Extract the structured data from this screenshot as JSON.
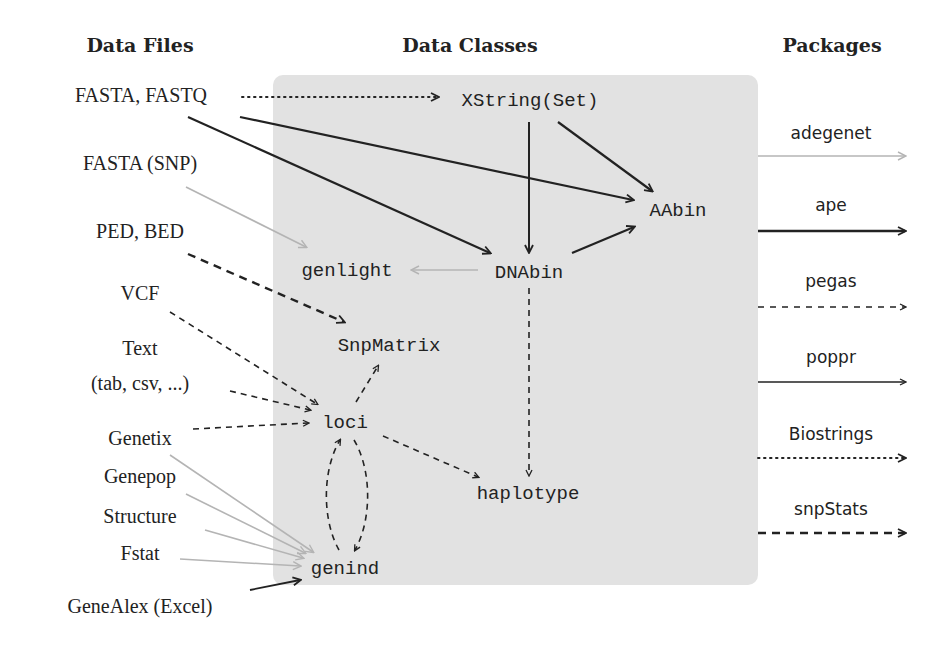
{
  "headers": {
    "files": "Data Files",
    "classes": "Data Classes",
    "packages": "Packages"
  },
  "files": [
    {
      "id": "fasta",
      "label": "FASTA, FASTQ"
    },
    {
      "id": "fasta_snp",
      "label": "FASTA (SNP)"
    },
    {
      "id": "ped",
      "label": "PED, BED"
    },
    {
      "id": "vcf",
      "label": "VCF"
    },
    {
      "id": "text1",
      "label": "Text"
    },
    {
      "id": "text2",
      "label": "(tab, csv, ...)"
    },
    {
      "id": "genetix",
      "label": "Genetix"
    },
    {
      "id": "genepop",
      "label": "Genepop"
    },
    {
      "id": "structure",
      "label": "Structure"
    },
    {
      "id": "fstat",
      "label": "Fstat"
    },
    {
      "id": "genealex",
      "label": "GeneAlex (Excel)"
    }
  ],
  "classes": [
    {
      "id": "xstring",
      "label": "XString(Set)"
    },
    {
      "id": "aabin",
      "label": "AAbin"
    },
    {
      "id": "genlight",
      "label": "genlight"
    },
    {
      "id": "dnabin",
      "label": "DNAbin"
    },
    {
      "id": "snpmatrix",
      "label": "SnpMatrix"
    },
    {
      "id": "loci",
      "label": "loci"
    },
    {
      "id": "haplotype",
      "label": "haplotype"
    },
    {
      "id": "genind",
      "label": "genind"
    }
  ],
  "packages": [
    {
      "name": "adegenet",
      "style": "gray-solid"
    },
    {
      "name": "ape",
      "style": "black-solid-thick"
    },
    {
      "name": "pegas",
      "style": "dashed"
    },
    {
      "name": "poppr",
      "style": "solid-thin"
    },
    {
      "name": "Biostrings",
      "style": "dotted"
    },
    {
      "name": "snpStats",
      "style": "dashed-thick"
    }
  ],
  "colors": {
    "panel": "#e2e2e2",
    "ink": "#222222",
    "adegenet": "#b4b4b4"
  }
}
